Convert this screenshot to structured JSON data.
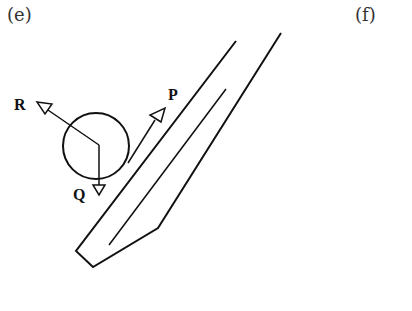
{
  "panels": [
    {
      "label": "(e)"
    },
    {
      "label": "(f)"
    }
  ],
  "diagram": {
    "forces": {
      "R": "R",
      "P": "P",
      "Q": "Q"
    },
    "stroke_color": "#111111"
  }
}
